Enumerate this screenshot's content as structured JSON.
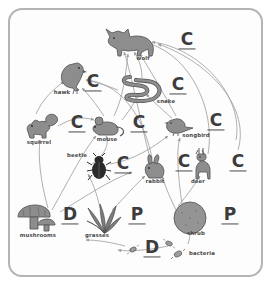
{
  "diagram": {
    "frame": {
      "border_color": "#b4b4b4",
      "background": "#fdfdfd"
    },
    "palette": {
      "silhouette_fill": "#8d8d8d",
      "silhouette_stroke": "#5a5a5a",
      "beetle_fill": "#2b2b2b",
      "arrow_color": "#9a9a9a",
      "letter_color": "#3c3c3c",
      "label_color": "#4a4a4a"
    },
    "role_key": {
      "C": "consumer",
      "P": "producer",
      "D": "decomposer"
    },
    "organisms": [
      {
        "id": "wolf",
        "label": "wolf",
        "role": "C",
        "icon": "wolf-icon",
        "x": 130,
        "y": 42,
        "label_x": 143,
        "label_y": 61,
        "tag_x": 187,
        "tag_y": 41
      },
      {
        "id": "hawk",
        "label": "hawk",
        "role": "C",
        "icon": "hawk-icon",
        "x": 72,
        "y": 78,
        "label_x": 62,
        "label_y": 94,
        "tag_x": 93,
        "tag_y": 83
      },
      {
        "id": "snake",
        "label": "snake",
        "role": "C",
        "icon": "snake-icon",
        "x": 142,
        "y": 88,
        "label_x": 166,
        "label_y": 103,
        "tag_x": 178,
        "tag_y": 86
      },
      {
        "id": "squirrel",
        "label": "squirrel",
        "role": "C",
        "icon": "squirrel-icon",
        "x": 42,
        "y": 127,
        "label_x": 39,
        "label_y": 142,
        "tag_x": 77,
        "tag_y": 124
      },
      {
        "id": "mouse",
        "label": "mouse",
        "role": "C",
        "icon": "mouse-icon",
        "x": 109,
        "y": 126,
        "label_x": 107,
        "label_y": 139,
        "tag_x": 139,
        "tag_y": 124
      },
      {
        "id": "songbird",
        "label": "songbird",
        "role": "C",
        "icon": "songbird-icon",
        "x": 180,
        "y": 126,
        "label_x": 196,
        "label_y": 136,
        "tag_x": 216,
        "tag_y": 122
      },
      {
        "id": "beetle",
        "label": "beetle",
        "role": "C",
        "icon": "beetle-icon",
        "x": 99,
        "y": 168,
        "label_x": 77,
        "label_y": 154,
        "tag_x": 123,
        "tag_y": 165
      },
      {
        "id": "rabbit",
        "label": "rabbit",
        "role": "C",
        "icon": "rabbit-icon",
        "x": 155,
        "y": 167,
        "label_x": 155,
        "label_y": 180,
        "tag_x": 184,
        "tag_y": 163
      },
      {
        "id": "deer",
        "label": "deer",
        "role": "C",
        "icon": "deer-icon",
        "x": 204,
        "y": 165,
        "label_x": 198,
        "label_y": 180,
        "tag_x": 238,
        "tag_y": 163
      },
      {
        "id": "mushrooms",
        "label": "mushrooms",
        "role": "D",
        "icon": "mushrooms-icon",
        "x": 37,
        "y": 219,
        "label_x": 38,
        "label_y": 234,
        "tag_x": 70,
        "tag_y": 216
      },
      {
        "id": "grasses",
        "label": "grasses",
        "role": "P",
        "icon": "grasses-icon",
        "x": 104,
        "y": 218,
        "label_x": 97,
        "label_y": 234,
        "tag_x": 137,
        "tag_y": 216
      },
      {
        "id": "shrub",
        "label": "shrub",
        "role": "P",
        "icon": "shrub-icon",
        "x": 190,
        "y": 218,
        "label_x": 196,
        "label_y": 233,
        "tag_x": 230,
        "tag_y": 216
      },
      {
        "id": "bacteria",
        "label": "bacteria",
        "role": "D",
        "icon": "bacteria-icon",
        "x": 178,
        "y": 254,
        "label_x": 199,
        "label_y": 251,
        "tag_x": 152,
        "tag_y": 249
      }
    ]
  }
}
